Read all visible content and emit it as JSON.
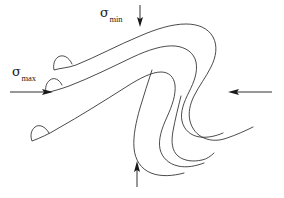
{
  "figure": {
    "background_color": "#ffffff",
    "stroke_color": "#2b2b2b",
    "arrow_color": "#1a1a1a",
    "width": 284,
    "height": 198,
    "labels": {
      "sigma_min": {
        "symbol": "σ",
        "subscript": "min",
        "full_text": "σmin"
      },
      "sigma_max": {
        "symbol": "σ",
        "subscript": "max",
        "full_text": "σmax"
      }
    },
    "arrows": [
      {
        "name": "sigma-min-arrow-top",
        "direction": "down",
        "x": 140,
        "y_start": 6,
        "y_end": 26
      },
      {
        "name": "sigma-max-arrow-left",
        "direction": "right",
        "y": 92,
        "x_start": 10,
        "x_end": 52
      },
      {
        "name": "sigma-min-arrow-bottom",
        "direction": "up",
        "x": 137,
        "y_start": 186,
        "y_end": 162
      },
      {
        "name": "sigma-max-arrow-right",
        "direction": "left",
        "y": 92,
        "x_start": 272,
        "x_end": 228
      }
    ],
    "curves": [
      {
        "name": "outer-fold-curve"
      },
      {
        "name": "middle-fold-curve"
      },
      {
        "name": "inner-fold-curve"
      },
      {
        "name": "lower-left-tail-curve"
      },
      {
        "name": "lower-right-tail-curve"
      }
    ]
  }
}
